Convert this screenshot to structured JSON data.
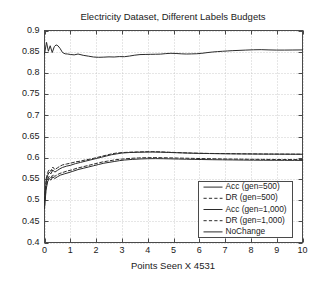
{
  "chart_data": {
    "type": "line",
    "title": "Electricity Dataset, Different Labels Budgets",
    "xlabel": "Points Seen X 4531",
    "ylabel": "",
    "xlim": [
      0,
      10
    ],
    "ylim": [
      0.4,
      0.9
    ],
    "grid": true,
    "legend_position": "lower right",
    "xticks": [
      "0",
      "1",
      "2",
      "3",
      "4",
      "5",
      "6",
      "7",
      "8",
      "9",
      "10"
    ],
    "xtick_values": [
      0,
      1,
      2,
      3,
      4,
      5,
      6,
      7,
      8,
      9,
      10
    ],
    "yticks": [
      "0.4",
      "0.45",
      "0.5",
      "0.55",
      "0.6",
      "0.65",
      "0.7",
      "0.75",
      "0.8",
      "0.85",
      "0.9"
    ],
    "ytick_values": [
      0.4,
      0.45,
      0.5,
      0.55,
      0.6,
      0.65,
      0.7,
      0.75,
      0.8,
      0.85,
      0.9
    ],
    "series": [
      {
        "name": "Acc (gen=500)",
        "style": "solid",
        "color": "#2b2b2b",
        "x": [
          0.0,
          0.08,
          0.15,
          0.22,
          0.3,
          0.38,
          0.45,
          0.52,
          0.6,
          0.7,
          0.8,
          0.9,
          1.0,
          1.15,
          1.3,
          1.5,
          1.7,
          1.9,
          2.1,
          2.3,
          2.5,
          2.7,
          2.9,
          3.1,
          3.3,
          3.5,
          3.7,
          3.9,
          4.1,
          4.3,
          4.5,
          4.7,
          4.9,
          5.1,
          5.3,
          5.5,
          5.7,
          5.9,
          6.1,
          6.3,
          6.5,
          6.7,
          6.9,
          7.1,
          7.3,
          7.5,
          7.8,
          8.1,
          8.4,
          8.7,
          9.0,
          9.3,
          9.6,
          10.0
        ],
        "y": [
          0.845,
          0.872,
          0.851,
          0.864,
          0.848,
          0.862,
          0.866,
          0.864,
          0.858,
          0.848,
          0.845,
          0.8445,
          0.8435,
          0.8425,
          0.8445,
          0.8415,
          0.8395,
          0.8375,
          0.8368,
          0.8372,
          0.8378,
          0.8375,
          0.8385,
          0.8382,
          0.8398,
          0.8418,
          0.8432,
          0.8435,
          0.8438,
          0.844,
          0.8443,
          0.8455,
          0.8462,
          0.8458,
          0.845,
          0.8445,
          0.8448,
          0.8452,
          0.8462,
          0.8478,
          0.8492,
          0.8502,
          0.851,
          0.8518,
          0.8525,
          0.853,
          0.8538,
          0.8545,
          0.8548,
          0.8542,
          0.8538,
          0.8538,
          0.854,
          0.8542
        ]
      },
      {
        "name": "DR (gen=500)",
        "style": "dashed",
        "color": "#2b2b2b",
        "x": [
          0.0,
          0.06,
          0.12,
          0.18,
          0.25,
          0.32,
          0.4,
          0.5,
          0.6,
          0.7,
          0.85,
          1.0,
          1.2,
          1.4,
          1.6,
          1.8,
          2.0,
          2.2,
          2.4,
          2.6,
          2.8,
          3.0,
          3.3,
          3.6,
          3.9,
          4.2,
          4.5,
          4.8,
          5.1,
          5.4,
          5.7,
          6.0,
          6.4,
          6.8,
          7.2,
          7.6,
          8.0,
          8.4,
          8.8,
          9.2,
          9.6,
          10.0
        ],
        "y": [
          0.5,
          0.548,
          0.565,
          0.572,
          0.568,
          0.578,
          0.572,
          0.576,
          0.58,
          0.583,
          0.585,
          0.587,
          0.59,
          0.592,
          0.595,
          0.597,
          0.6,
          0.603,
          0.606,
          0.609,
          0.611,
          0.612,
          0.613,
          0.6135,
          0.614,
          0.6142,
          0.6138,
          0.613,
          0.6122,
          0.6115,
          0.611,
          0.6105,
          0.61,
          0.6098,
          0.6095,
          0.6092,
          0.609,
          0.6088,
          0.6086,
          0.6085,
          0.6084,
          0.6083
        ]
      },
      {
        "name": "Acc (gen=1,000)",
        "style": "solid",
        "color": "#2b2b2b",
        "x": [
          0.0,
          0.06,
          0.12,
          0.18,
          0.25,
          0.32,
          0.4,
          0.5,
          0.6,
          0.7,
          0.85,
          1.0,
          1.2,
          1.4,
          1.6,
          1.8,
          2.0,
          2.2,
          2.4,
          2.6,
          2.8,
          3.0,
          3.3,
          3.6,
          3.9,
          4.2,
          4.5,
          4.8,
          5.1,
          5.4,
          5.7,
          6.0,
          6.4,
          6.8,
          7.2,
          7.6,
          8.0,
          8.4,
          8.8,
          9.2,
          9.6,
          10.0
        ],
        "y": [
          0.495,
          0.54,
          0.558,
          0.566,
          0.562,
          0.571,
          0.566,
          0.57,
          0.574,
          0.577,
          0.58,
          0.582,
          0.586,
          0.589,
          0.592,
          0.595,
          0.598,
          0.601,
          0.604,
          0.607,
          0.609,
          0.611,
          0.6122,
          0.6128,
          0.6132,
          0.6134,
          0.613,
          0.6124,
          0.6118,
          0.6112,
          0.6106,
          0.6102,
          0.6098,
          0.6094,
          0.6091,
          0.6089,
          0.6087,
          0.6085,
          0.6084,
          0.6083,
          0.6082,
          0.6081
        ]
      },
      {
        "name": "DR (gen=1,000)",
        "style": "dashed",
        "color": "#2b2b2b",
        "x": [
          0.0,
          0.06,
          0.12,
          0.18,
          0.25,
          0.32,
          0.4,
          0.5,
          0.6,
          0.75,
          0.9,
          1.05,
          1.25,
          1.45,
          1.65,
          1.85,
          2.05,
          2.25,
          2.45,
          2.65,
          2.85,
          3.05,
          3.35,
          3.65,
          3.95,
          4.25,
          4.55,
          4.85,
          5.15,
          5.45,
          5.75,
          6.05,
          6.45,
          6.85,
          7.25,
          7.65,
          8.05,
          8.45,
          8.85,
          9.25,
          9.65,
          10.0
        ],
        "y": [
          0.486,
          0.53,
          0.548,
          0.556,
          0.552,
          0.56,
          0.556,
          0.56,
          0.563,
          0.566,
          0.569,
          0.571,
          0.575,
          0.578,
          0.581,
          0.584,
          0.587,
          0.59,
          0.592,
          0.594,
          0.596,
          0.597,
          0.5985,
          0.5995,
          0.6,
          0.6002,
          0.6,
          0.5996,
          0.5992,
          0.5988,
          0.5984,
          0.598,
          0.5976,
          0.5972,
          0.5968,
          0.5965,
          0.5962,
          0.596,
          0.5958,
          0.5957,
          0.5956,
          0.5955
        ]
      },
      {
        "name": "NoChange",
        "style": "solid",
        "color": "#2b2b2b",
        "x": [
          0.0,
          0.06,
          0.12,
          0.18,
          0.25,
          0.32,
          0.4,
          0.5,
          0.62,
          0.78,
          0.95,
          1.1,
          1.3,
          1.5,
          1.7,
          1.9,
          2.1,
          2.3,
          2.5,
          2.7,
          2.9,
          3.1,
          3.4,
          3.7,
          4.0,
          4.3,
          4.6,
          4.9,
          5.2,
          5.5,
          5.8,
          6.1,
          6.5,
          6.9,
          7.3,
          7.7,
          8.1,
          8.5,
          8.9,
          9.3,
          9.7,
          10.0
        ],
        "y": [
          0.48,
          0.524,
          0.543,
          0.551,
          0.547,
          0.555,
          0.551,
          0.555,
          0.559,
          0.562,
          0.565,
          0.568,
          0.572,
          0.575,
          0.578,
          0.581,
          0.584,
          0.587,
          0.589,
          0.591,
          0.593,
          0.5945,
          0.596,
          0.597,
          0.5976,
          0.5978,
          0.5976,
          0.5972,
          0.5968,
          0.5964,
          0.596,
          0.5957,
          0.5953,
          0.595,
          0.5947,
          0.5944,
          0.5942,
          0.594,
          0.5939,
          0.5938,
          0.5937,
          0.5936
        ]
      }
    ]
  }
}
